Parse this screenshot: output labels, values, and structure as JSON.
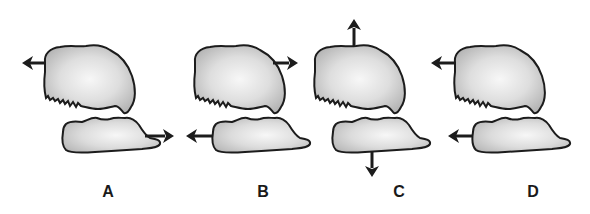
{
  "figure": {
    "colors": {
      "outline": "#1c1c1c",
      "fill_center": "#f4f4f4",
      "fill_edge": "#b9b9b9",
      "arrow": "#1c1c1c",
      "background": "#ffffff"
    },
    "panels": [
      {
        "id": "A",
        "label": "A",
        "label_x": 108,
        "offset_x": 0,
        "upper_arrow": "left",
        "lower_arrow": "right"
      },
      {
        "id": "B",
        "label": "B",
        "label_x": 263,
        "offset_x": 150,
        "upper_arrow": "right",
        "lower_arrow": "left"
      },
      {
        "id": "C",
        "label": "C",
        "label_x": 399,
        "offset_x": 271,
        "upper_arrow": "up",
        "lower_arrow": "down"
      },
      {
        "id": "D",
        "label": "D",
        "label_x": 533,
        "offset_x": 410,
        "upper_arrow": "left",
        "lower_arrow": "left"
      }
    ]
  }
}
